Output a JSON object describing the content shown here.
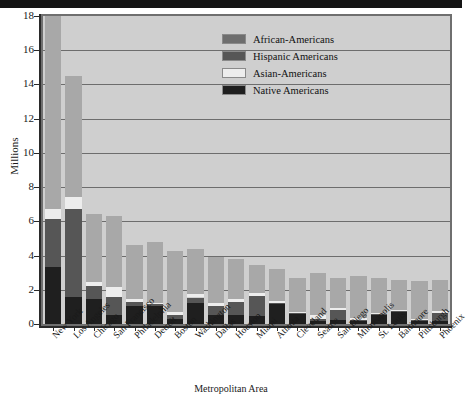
{
  "figure": {
    "y_axis_title": "Millions",
    "x_axis_title": "Metropolitan Area"
  },
  "legend": {
    "items": [
      {
        "label": "African-Americans",
        "color": "#6e6e6e"
      },
      {
        "label": "Hispanic Americans",
        "color": "#565656"
      },
      {
        "label": "Asian-Americans",
        "color": "#ededed"
      },
      {
        "label": "Native Americans",
        "color": "#1f1f1f"
      }
    ]
  },
  "chart_data": {
    "type": "bar",
    "title": "",
    "subtitle": "",
    "stacked": true,
    "xlabel": "Metropolitan Area",
    "ylabel": "Millions",
    "ylim": [
      0,
      18
    ],
    "yticks": [
      0,
      2,
      4,
      6,
      8,
      10,
      12,
      14,
      16,
      18
    ],
    "ytick_labels": [
      "0",
      "2",
      "4",
      "6",
      "8",
      "10",
      "12",
      "14",
      "16",
      "18"
    ],
    "grid": true,
    "grid_axis": "y",
    "legend_position": "upper center",
    "categories": [
      "New York",
      "Los Angeles",
      "Chicago",
      "San Francisco",
      "Philadelphia",
      "Detroit",
      "Boston",
      "Washington",
      "Dallas",
      "Houston",
      "Miami",
      "Atlanta",
      "Cleveland",
      "Seattle",
      "San Diego",
      "Minneapolis",
      "St. Louis",
      "Baltimore",
      "Pittsburgh",
      "Phoenix"
    ],
    "series": [
      {
        "name": "Native Americans",
        "color": "#1f1f1f",
        "values": [
          3.35,
          1.55,
          1.45,
          0.55,
          1.05,
          1.05,
          0.3,
          1.25,
          0.5,
          0.55,
          0.45,
          1.15,
          0.6,
          0.2,
          0.25,
          0.2,
          0.55,
          0.7,
          0.2,
          0.2
        ]
      },
      {
        "name": "Asian-Americans",
        "color": "#ededed",
        "values": [
          0.55,
          0.75,
          0.25,
          0.6,
          0.15,
          0.1,
          0.15,
          0.2,
          0.15,
          0.15,
          0.15,
          0.1,
          0.05,
          0.2,
          0.15,
          0.1,
          0.05,
          0.05,
          0.05,
          0.1
        ]
      },
      {
        "name": "Hispanic Americans",
        "color": "#565656",
        "values": [
          2.8,
          5.15,
          0.75,
          1.0,
          0.25,
          0.1,
          0.25,
          0.3,
          0.55,
          0.75,
          1.2,
          0.1,
          0.05,
          0.1,
          0.55,
          0.05,
          0.05,
          0.05,
          0.05,
          0.45
        ]
      },
      {
        "name": "African-Americans",
        "color": "#a8a8a8",
        "values": [
          11.3,
          7.05,
          4.0,
          4.15,
          3.15,
          3.55,
          3.55,
          2.65,
          2.7,
          2.35,
          1.65,
          1.85,
          2.0,
          2.5,
          1.75,
          2.45,
          2.05,
          1.8,
          2.2,
          1.85
        ]
      }
    ],
    "totals": [
      18.0,
      14.5,
      6.45,
      6.3,
      4.6,
      4.8,
      4.25,
      4.4,
      3.9,
      3.8,
      3.45,
      3.2,
      2.7,
      3.0,
      2.7,
      2.8,
      2.7,
      2.6,
      2.5,
      2.6
    ]
  }
}
